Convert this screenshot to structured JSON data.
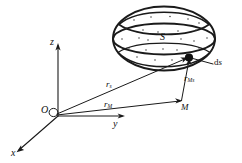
{
  "figure": {
    "background_color": "#ffffff",
    "stroke_color": "#1a1a1a",
    "canvas": {
      "width": 242,
      "height": 163
    }
  },
  "axes": {
    "origin_label": "O",
    "x_label": "x",
    "y_label": "y",
    "z_label": "z"
  },
  "surface": {
    "label": "S",
    "element_label": "ds",
    "element_label_prefix": "d",
    "element_label_suffix": "s"
  },
  "points": {
    "field_point_label": "M"
  },
  "vectors": [
    {
      "name": "r-sub-s",
      "base": "r",
      "subscript": "s"
    },
    {
      "name": "r-sub-M",
      "base": "r",
      "subscript": "M"
    },
    {
      "name": "r-sub-Ms",
      "base": "r",
      "subscript": "Ms"
    }
  ]
}
